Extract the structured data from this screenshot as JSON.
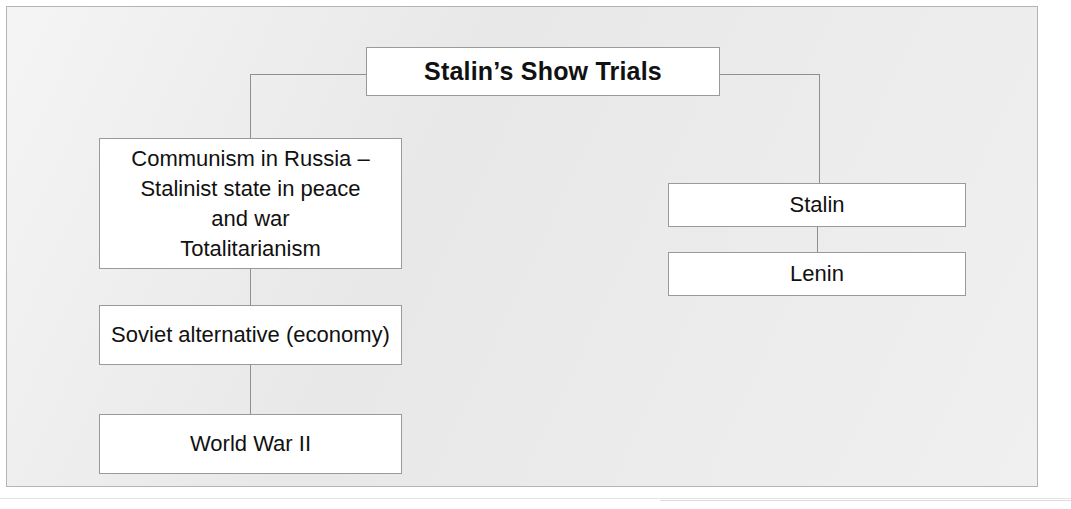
{
  "diagram": {
    "type": "tree-flowchart",
    "background_color": "#e8e8e8",
    "node_fill_color": "#ffffff",
    "node_border_color": "#9a9a9a",
    "connector_color": "#8f8f8f",
    "text_color": "#111111",
    "nodes": [
      {
        "id": "root",
        "label": "Stalin’s Show Trials",
        "bold": true
      },
      {
        "id": "communism",
        "label": "Communism in Russia –\nStalinist state in peace\nand war\nTotalitarianism"
      },
      {
        "id": "soviet",
        "label": "Soviet alternative (economy)"
      },
      {
        "id": "wwii",
        "label": "World War II"
      },
      {
        "id": "stalin",
        "label": "Stalin"
      },
      {
        "id": "lenin",
        "label": "Lenin"
      }
    ],
    "edges": [
      {
        "from": "root",
        "to": "communism"
      },
      {
        "from": "root",
        "to": "stalin"
      },
      {
        "from": "communism",
        "to": "soviet"
      },
      {
        "from": "soviet",
        "to": "wwii"
      },
      {
        "from": "stalin",
        "to": "lenin"
      }
    ]
  }
}
